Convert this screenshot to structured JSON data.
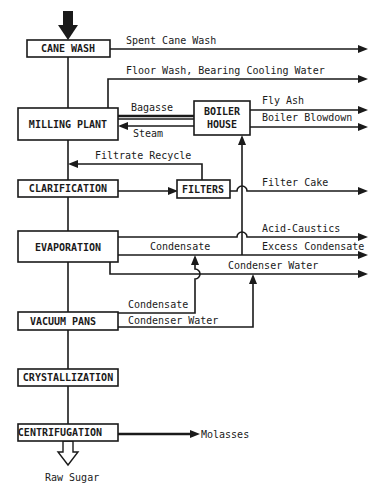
{
  "diagram": {
    "type": "process-flow",
    "title": "",
    "stages": [
      {
        "id": "cane_wash",
        "label": "CANE WASH"
      },
      {
        "id": "milling_plant",
        "label": "MILLING PLANT"
      },
      {
        "id": "boiler_house",
        "label_line1": "BOILER",
        "label_line2": "HOUSE"
      },
      {
        "id": "clarification",
        "label": "CLARIFICATION"
      },
      {
        "id": "filters",
        "label": "FILTERS"
      },
      {
        "id": "evaporation",
        "label": "EVAPORATION"
      },
      {
        "id": "vacuum_pans",
        "label": "VACUUM PANS"
      },
      {
        "id": "crystallization",
        "label": "CRYSTALLIZATION"
      },
      {
        "id": "centrifugation",
        "label": "CENTRIFUGATION"
      }
    ],
    "streams": {
      "spent_cane_wash": "Spent Cane Wash",
      "floor_wash": "Floor Wash, Bearing Cooling Water",
      "bagasse": "Bagasse",
      "steam": "Steam",
      "fly_ash": "Fly Ash",
      "boiler_blowdown": "Boiler Blowdown",
      "filtrate_recycle": "Filtrate Recycle",
      "filter_cake": "Filter Cake",
      "acid_caustics": "Acid-Caustics",
      "evap_condensate": "Condensate",
      "excess_condensate": "Excess Condensate",
      "condenser_water_out": "Condenser Water",
      "pans_condensate": "Condensate",
      "pans_condenser_water": "Condenser Water",
      "molasses": "Molasses",
      "raw_sugar": "Raw Sugar"
    },
    "edges": [
      {
        "from": "input",
        "to": "cane_wash"
      },
      {
        "from": "cane_wash",
        "to": "Spent Cane Wash"
      },
      {
        "from": "cane_wash",
        "to": "milling_plant"
      },
      {
        "from": "milling_plant",
        "to": "Floor Wash, Bearing Cooling Water"
      },
      {
        "from": "milling_plant",
        "to": "boiler_house",
        "label": "Bagasse"
      },
      {
        "from": "boiler_house",
        "to": "milling_plant",
        "label": "Steam"
      },
      {
        "from": "boiler_house",
        "to": "Fly Ash"
      },
      {
        "from": "boiler_house",
        "to": "Boiler Blowdown"
      },
      {
        "from": "milling_plant",
        "to": "clarification"
      },
      {
        "from": "clarification",
        "to": "filters"
      },
      {
        "from": "filters",
        "to": "clarification",
        "label": "Filtrate Recycle"
      },
      {
        "from": "filters",
        "to": "Filter Cake"
      },
      {
        "from": "clarification",
        "to": "evaporation"
      },
      {
        "from": "evaporation",
        "to": "Acid-Caustics"
      },
      {
        "from": "evaporation",
        "to": "Excess Condensate",
        "label": "Condensate"
      },
      {
        "from": "evaporation",
        "to": "boiler_house",
        "label": "Condensate"
      },
      {
        "from": "evaporation",
        "to": "Condenser Water"
      },
      {
        "from": "evaporation",
        "to": "vacuum_pans"
      },
      {
        "from": "vacuum_pans",
        "to": "Excess Condensate",
        "label": "Condensate"
      },
      {
        "from": "vacuum_pans",
        "to": "Condenser Water",
        "label": "Condenser Water"
      },
      {
        "from": "vacuum_pans",
        "to": "crystallization"
      },
      {
        "from": "crystallization",
        "to": "centrifugation"
      },
      {
        "from": "centrifugation",
        "to": "Molasses"
      },
      {
        "from": "centrifugation",
        "to": "Raw Sugar"
      }
    ]
  }
}
